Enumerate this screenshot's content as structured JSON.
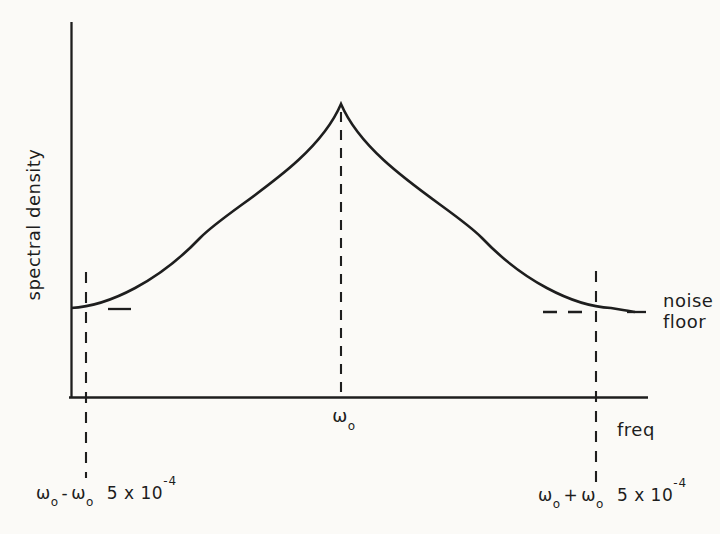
{
  "canvas": {
    "background": "#fbfaf7",
    "ink_color": "#1e1e1e"
  },
  "chart_data": {
    "type": "line",
    "title": "",
    "xlabel": "freq",
    "ylabel": "spectral density",
    "grid": false,
    "legend": "none",
    "x_ticks": [
      {
        "label": "ω₀ - ω₀ 5 x 10⁻⁴",
        "x_rel": 0.026
      },
      {
        "label": "ω₀",
        "x_rel": 0.468
      },
      {
        "label": "ω₀ + ω₀ 5 x 10⁻⁴",
        "x_rel": 0.91
      }
    ],
    "annotations": [
      {
        "text": "noise floor",
        "y_rel": 0.235,
        "position": "right of plot at noise-floor level"
      }
    ],
    "noise_floor_rel": 0.235,
    "series": [
      {
        "name": "spectral density",
        "x_rel": [
          0.0,
          0.05,
          0.097,
          0.154,
          0.211,
          0.27,
          0.327,
          0.374,
          0.423,
          0.468,
          0.513,
          0.561,
          0.608,
          0.665,
          0.724,
          0.782,
          0.839,
          0.886,
          0.936,
          0.977
        ],
        "y_rel": [
          0.237,
          0.245,
          0.285,
          0.347,
          0.413,
          0.477,
          0.539,
          0.579,
          0.672,
          0.781,
          0.672,
          0.579,
          0.539,
          0.477,
          0.413,
          0.347,
          0.285,
          0.245,
          0.237,
          0.227
        ]
      }
    ]
  },
  "labels": {
    "ylabel": "spectral density",
    "xlabel": "freq",
    "noise_line1": "noise",
    "noise_line2": "floor",
    "peak_tick": {
      "omega": "ω",
      "sub": "o"
    },
    "left_limit": {
      "w1": "ω",
      "s1": "o",
      "op": "-",
      "w2": "ω",
      "s2": "o",
      "coef": "5 x 10",
      "exp": "-4"
    },
    "right_limit": {
      "w1": "ω",
      "s1": "o",
      "op": "+",
      "w2": "ω",
      "s2": "o",
      "coef": "5 x 10",
      "exp": "-4"
    }
  },
  "geometry": {
    "y_axis": "M 71.5 22 L 71.5 398",
    "x_axis": "M 69 397.5 L 648 397.5",
    "curve": "M 71 308 C 110 306 160 280 200 238 C 230 207 315 165 341 104 C 367 165 452 207 482 238 C 522 280 572 306 611 308 C 621 309.5 628 311 635 312",
    "peak_dash": "M 341 112 L 341 396",
    "left_dash_v": "M 86 272 L 86 478",
    "right_dash_v": "M 596 271 L 596 487",
    "left_dash_h": "M 108 309 L 131 309",
    "right_dash_h1": "M 543 312 L 589 312",
    "right_dash_h2": "M 627 312 L 646 312"
  }
}
